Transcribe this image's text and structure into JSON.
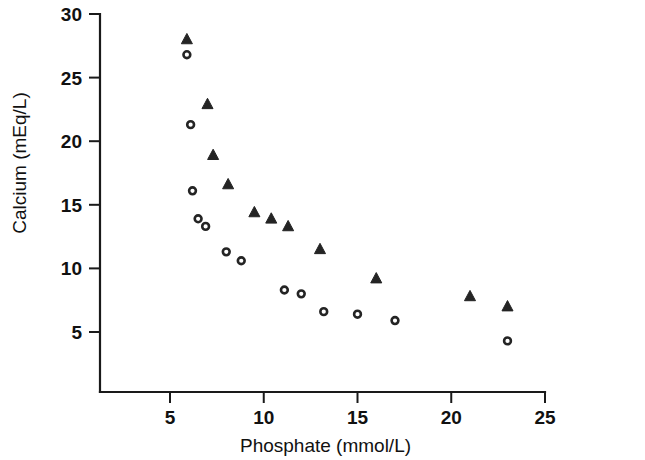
{
  "chart_data": {
    "type": "scatter",
    "title": "",
    "subtitle": "",
    "xlabel": "Phosphate (mmol/L)",
    "ylabel": "Calcium (mEq/L)",
    "xlim": [
      3.0,
      25.0
    ],
    "ylim": [
      2.0,
      30.0
    ],
    "xticks": [
      5,
      10,
      15,
      20,
      25
    ],
    "xtick_labels": [
      "5",
      "10",
      "15",
      "20",
      "25"
    ],
    "yticks": [
      5,
      10,
      15,
      20,
      25,
      30
    ],
    "ytick_labels": [
      "5",
      "10",
      "15",
      "20",
      "25",
      "30"
    ],
    "grid": false,
    "legend": null,
    "legend_position": "none",
    "marker_color": "#242424",
    "series": [
      {
        "name": "triangle",
        "marker": "triangle",
        "filled": true,
        "points": [
          {
            "x": 5.9,
            "y": 28.0
          },
          {
            "x": 7.0,
            "y": 22.9
          },
          {
            "x": 7.3,
            "y": 18.9
          },
          {
            "x": 8.1,
            "y": 16.6
          },
          {
            "x": 9.5,
            "y": 14.4
          },
          {
            "x": 10.4,
            "y": 13.9
          },
          {
            "x": 11.3,
            "y": 13.3
          },
          {
            "x": 13.0,
            "y": 11.5
          },
          {
            "x": 16.0,
            "y": 9.2
          },
          {
            "x": 21.0,
            "y": 7.8
          },
          {
            "x": 23.0,
            "y": 7.0
          }
        ]
      },
      {
        "name": "circle",
        "marker": "circle",
        "filled": false,
        "points": [
          {
            "x": 5.9,
            "y": 26.8
          },
          {
            "x": 6.1,
            "y": 21.3
          },
          {
            "x": 6.2,
            "y": 16.1
          },
          {
            "x": 6.5,
            "y": 13.9
          },
          {
            "x": 6.9,
            "y": 13.3
          },
          {
            "x": 8.0,
            "y": 11.3
          },
          {
            "x": 8.8,
            "y": 10.6
          },
          {
            "x": 11.1,
            "y": 8.3
          },
          {
            "x": 12.0,
            "y": 8.0
          },
          {
            "x": 13.2,
            "y": 6.6
          },
          {
            "x": 15.0,
            "y": 6.4
          },
          {
            "x": 17.0,
            "y": 5.9
          },
          {
            "x": 23.0,
            "y": 4.3
          }
        ]
      }
    ]
  }
}
